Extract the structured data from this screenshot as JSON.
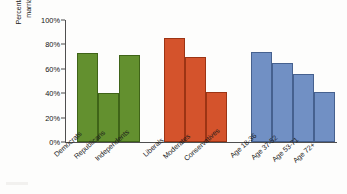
{
  "chart_data": {
    "type": "bar",
    "title": "",
    "subtitle": "",
    "xlabel": "",
    "ylabel": "Percentage saying same-sex marriage should be legal",
    "ylabel_lines": [
      "Percentage saying same-sex",
      "marriage should be legal"
    ],
    "ylim": [
      0,
      100
    ],
    "yticks": [
      0,
      20,
      40,
      60,
      80,
      100
    ],
    "ytick_labels": [
      "0%",
      "20%",
      "40%",
      "60%",
      "80%",
      "100%"
    ],
    "grid": false,
    "legend": "none",
    "value_unit": "%",
    "groups": [
      {
        "name": "Party affiliation",
        "color": "#63902f",
        "categories": [
          "Democrats",
          "Republicans",
          "Independents"
        ],
        "values": [
          73,
          40,
          71
        ]
      },
      {
        "name": "Political ideology",
        "color": "#d4532c",
        "categories": [
          "Liberals",
          "Moderates",
          "Conservatives"
        ],
        "values": [
          85,
          70,
          41
        ]
      },
      {
        "name": "Age cohort",
        "color": "#7190c4",
        "categories": [
          "Age 18-36",
          "Age 37-52",
          "Age 53-71",
          "Age 72+"
        ],
        "values": [
          74,
          65,
          56,
          41
        ]
      }
    ],
    "categories": [
      "Democrats",
      "Republicans",
      "Independents",
      "Liberals",
      "Moderates",
      "Conservatives",
      "Age 18-36",
      "Age 37-52",
      "Age 53-71",
      "Age 72+"
    ],
    "values": [
      73,
      40,
      71,
      85,
      70,
      41,
      74,
      65,
      56,
      41
    ],
    "colors": [
      "#63902f",
      "#63902f",
      "#63902f",
      "#d4532c",
      "#d4532c",
      "#d4532c",
      "#7190c4",
      "#7190c4",
      "#7190c4",
      "#7190c4"
    ]
  },
  "axis": {
    "ytick_0": "0%",
    "ytick_1": "20%",
    "ytick_2": "40%",
    "ytick_3": "60%",
    "ytick_4": "80%",
    "ytick_5": "100%"
  },
  "labels": {
    "c0": "Democrats",
    "c1": "Republicans",
    "c2": "Independents",
    "c3": "Liberals",
    "c4": "Moderates",
    "c5": "Conservatives",
    "c6": "Age 18-36",
    "c7": "Age 37-52",
    "c8": "Age 53-71",
    "c9": "Age 72+"
  },
  "ylabel": {
    "line1": "Percentage saying same-sex",
    "line2": "marriage should be legal"
  }
}
